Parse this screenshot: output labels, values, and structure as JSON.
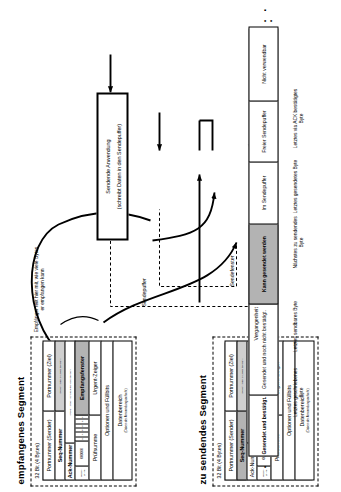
{
  "diagram": {
    "language": "de"
  },
  "received_segment": {
    "title": "empfangenes Segment",
    "width_caption": "32 Bit (4 Bytes)",
    "fields": {
      "src_port": "Portnummer (Sender)",
      "dst_port": "Portnummer (Ziel)",
      "seq_label": "Seq-Nummer",
      "seq_desc": "(Folgenummer aktuelles Segment)",
      "ack_label": "Ack-Nummer",
      "ack_desc": "(Folgenummer nächstes erwartetes Segment)",
      "offset_label": "Header-Länge",
      "flags_value": "000000",
      "flags_bits": [
        "U",
        "A",
        "P",
        "R",
        "S",
        "F"
      ],
      "window_label": "Empfangsfenster",
      "checksum": "Prüfsumme",
      "urgent": "Urgent-Zeiger",
      "options": "Optionen und Füllbits",
      "data_title": "Datenbereich",
      "data_sub": "(Daten der Anwendungsschicht)"
    }
  },
  "send_segment": {
    "title": "zu sendendes Segment",
    "width_caption": "32 Bit (4 Bytes)",
    "fields": {
      "src_port": "Portnummer (Sender)",
      "dst_port": "Portnummer (Ziel)",
      "seq_label": "Seq-Nummer",
      "seq_desc": "(Folgenummer aktuelles Segment)",
      "ack_label": "Ack-Nummer",
      "ack_desc": "(Folgenummer nächstes erwartetes Segment)",
      "offset_label": "Header-Länge",
      "flags_value": "0000000",
      "flags_bits": [
        "U",
        "A",
        "P",
        "R",
        "S",
        "F"
      ],
      "window_label": "Empfangsfenster",
      "checksum": "Prüfsumme",
      "urgent": "Urgent-Zeiger",
      "options": "Optionen und Füllbits",
      "data_title": "Datenbereich",
      "data_sub": "(Daten der Anwendungsschicht)"
    }
  },
  "buffer": {
    "segments": [
      {
        "id": "acked",
        "label": "Gesendet und bestätigt."
      },
      {
        "id": "unacked",
        "label": "Gesendet und noch nicht bestätigt."
      },
      {
        "id": "sendable",
        "label": "Kann gesendet werden"
      },
      {
        "id": "in_buffer",
        "label": "Im Sendepuffer"
      },
      {
        "id": "free_buffer",
        "label": "Freier Sendepuffer"
      },
      {
        "id": "unusable",
        "label": "Nicht verwendbar"
      }
    ],
    "ellipsis_start": "· · ·",
    "ellipsis_end": "· · ·"
  },
  "markers": {
    "past": "Vergangenheit",
    "send_window": "Sendefenster",
    "send_buffer": "Sendepuffer",
    "last_acked": "Letztes via ACK bestätigtes Byte",
    "last_sent": "Letztes gesendetes Byte",
    "next_to_send": "Nächstes zu sendendes Byte",
    "last_sendable": "Letztes sendbares Byte",
    "last_written": "Letztes geschriebenes Byte"
  },
  "notes": {
    "receiver_note": "Empfänger teilt hier mit, wie viele Bytes er empfangen kann",
    "app_box_title": "Sendende Anwendung",
    "app_box_sub": "(schreibt Daten in den Sendepuffer)"
  },
  "colors": {
    "shade_dark": "#b3b3b3",
    "shade_light": "#cfcfcf",
    "line": "#000000",
    "background": "#ffffff"
  }
}
